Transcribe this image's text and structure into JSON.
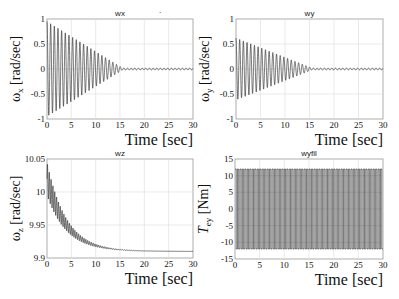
{
  "figure": {
    "width": 399,
    "height": 299,
    "background": "#ffffff",
    "line_color": "#222222",
    "grid_color": "#dcdcdc"
  },
  "chart_data": [
    {
      "type": "line",
      "id": "wx",
      "title": "wx",
      "xlabel": "Time [sec]",
      "ylabel": "ω_x [rad/sec]",
      "ylabel_main": "ω",
      "ylabel_sub": "x",
      "ylabel_unit": " [rad/sec]",
      "xlim": [
        0,
        30
      ],
      "ylim": [
        -1,
        1
      ],
      "xticks": [
        0,
        5,
        10,
        15,
        20,
        25,
        30
      ],
      "yticks": [
        -1,
        -0.5,
        0,
        0.5,
        1
      ],
      "ytick_labels": [
        "-1",
        "-0.5",
        "0",
        "0.5",
        "1"
      ],
      "grid": true,
      "signal": {
        "kind": "decaying_sine",
        "offset": 0,
        "amp0": 0.95,
        "amp_end": 0.02,
        "decay_until": 15.5,
        "freq_hz": 1.33,
        "residual_amp": 0.02
      },
      "box": {
        "left": 47,
        "top": 19,
        "right": 193,
        "bottom": 119
      }
    },
    {
      "type": "line",
      "id": "wy",
      "title": "wy",
      "xlabel": "Time [sec]",
      "ylabel": "ω_y [rad/sec]",
      "ylabel_main": "ω",
      "ylabel_sub": "y",
      "ylabel_unit": " [rad/sec]",
      "xlim": [
        0,
        30
      ],
      "ylim": [
        -1,
        1
      ],
      "xticks": [
        0,
        5,
        10,
        15,
        20,
        25,
        30
      ],
      "yticks": [
        -1,
        -0.5,
        0,
        0.5,
        1
      ],
      "ytick_labels": [
        "-1",
        "-0.5",
        "0",
        "0.5",
        "1"
      ],
      "grid": true,
      "signal": {
        "kind": "decaying_sine",
        "offset": 0,
        "amp0": 0.62,
        "amp_end": 0.02,
        "decay_until": 15.5,
        "freq_hz": 1.33,
        "residual_amp": 0.02
      },
      "box": {
        "left": 236,
        "top": 19,
        "right": 383,
        "bottom": 119
      }
    },
    {
      "type": "line",
      "id": "wz",
      "title": "wz",
      "xlabel": "Time [sec]",
      "ylabel": "ω_z [rad/sec]",
      "ylabel_main": "ω",
      "ylabel_sub": "z",
      "ylabel_unit": " [rad/sec]",
      "xlim": [
        0,
        30
      ],
      "ylim": [
        9.9,
        10.05
      ],
      "xticks": [
        0,
        5,
        10,
        15,
        20,
        25,
        30
      ],
      "yticks": [
        9.9,
        9.95,
        10,
        10.05
      ],
      "ytick_labels": [
        "9.9",
        "9.95",
        "10",
        "10.05"
      ],
      "grid": true,
      "signal": {
        "kind": "exp_decay_with_ripple",
        "start": 10.02,
        "final": 9.91,
        "tau": 4.0,
        "ripple0": 0.025,
        "freq_hz": 2.66
      },
      "box": {
        "left": 47,
        "top": 159,
        "right": 193,
        "bottom": 258
      }
    },
    {
      "type": "line",
      "id": "wyfil",
      "title": "wyfil",
      "xlabel": "Time [sec]",
      "ylabel": "T_ey [Nm]",
      "ylabel_main": "T",
      "ylabel_sub": "ey",
      "ylabel_unit": " [Nm]",
      "xlim": [
        0,
        30
      ],
      "ylim": [
        -15,
        15
      ],
      "xticks": [
        0,
        5,
        10,
        15,
        20,
        25,
        30
      ],
      "yticks": [
        -15,
        -10,
        -5,
        0,
        5,
        10,
        15
      ],
      "ytick_labels": [
        "-15",
        "-10",
        "-5",
        "0",
        "5",
        "10",
        "15"
      ],
      "grid": true,
      "signal": {
        "kind": "square_wave",
        "amplitude": 12,
        "period": 0.5
      },
      "box": {
        "left": 235,
        "top": 159,
        "right": 383,
        "bottom": 259
      }
    }
  ]
}
